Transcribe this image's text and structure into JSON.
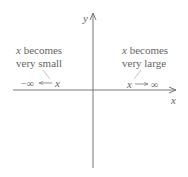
{
  "axes": {
    "x_label": "x",
    "y_label": "y"
  },
  "left_annotation": {
    "line1_var": "x",
    "line1_text": " becomes",
    "line2_text": "very small",
    "limit_expr_left": "−∞",
    "limit_expr_var": "x"
  },
  "right_annotation": {
    "line1_var": "x",
    "line1_text": " becomes",
    "line2_text": "very large",
    "limit_expr_var": "x",
    "limit_expr_right": "∞"
  },
  "colors": {
    "axis": "#777777",
    "text": "#666666"
  }
}
